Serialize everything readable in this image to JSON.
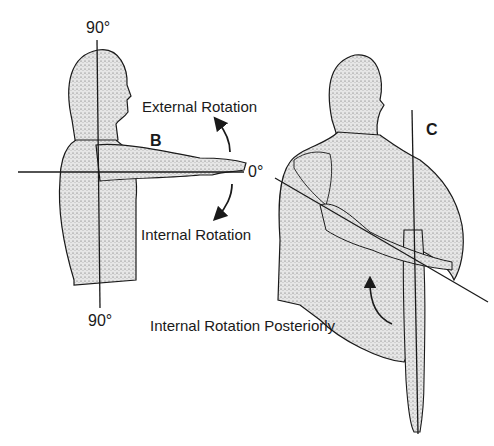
{
  "figure": {
    "panels": [
      {
        "id": "B",
        "letter": "B",
        "view": "lateral",
        "labels": {
          "top_angle": "90°",
          "bottom_angle": "90°",
          "zero_angle": "0°",
          "external": "External Rotation",
          "internal": "Internal Rotation"
        }
      },
      {
        "id": "C",
        "letter": "C",
        "view": "posterior",
        "labels": {
          "internal_posterior": "Internal Rotation Posteriorly"
        }
      }
    ],
    "colors": {
      "ink": "#1a1a1a",
      "stipple_fill": "#cfcfcf",
      "background": "#ffffff"
    }
  }
}
